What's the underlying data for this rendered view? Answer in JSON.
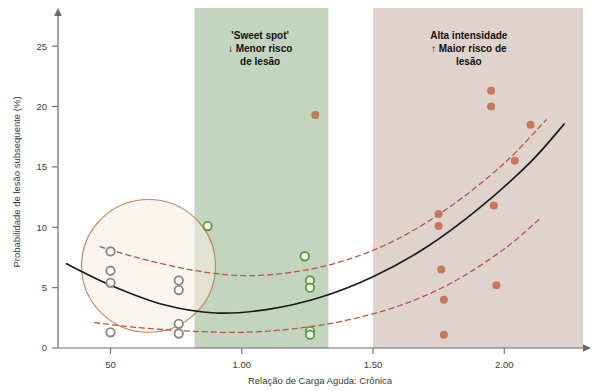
{
  "chart_data": {
    "type": "scatter",
    "title": "",
    "xlabel": "Relação de Carga Aguda: Crônica",
    "ylabel": "Probabilidade de lesão subsequente (%)",
    "xlim": [
      0.3,
      2.3
    ],
    "ylim": [
      0,
      27.5
    ],
    "xticks": [
      0.5,
      1.0,
      1.5,
      2.0
    ],
    "xticklabels": [
      "50",
      "1.00",
      "1.50",
      "2.00"
    ],
    "yticks": [
      0,
      5,
      10,
      15,
      20,
      25
    ],
    "yticklabels": [
      "0",
      "5",
      "10",
      "15",
      "20",
      "25"
    ],
    "grid": false,
    "legend": null,
    "series": [
      {
        "name": "Baixa carga (cinza)",
        "color": "#8a8a8a",
        "marker": "circle-open",
        "points": [
          {
            "x": 0.5,
            "y": 8.0
          },
          {
            "x": 0.5,
            "y": 6.4
          },
          {
            "x": 0.5,
            "y": 5.4
          },
          {
            "x": 0.5,
            "y": 1.3
          },
          {
            "x": 0.76,
            "y": 5.6
          },
          {
            "x": 0.76,
            "y": 4.8
          },
          {
            "x": 0.76,
            "y": 2.0
          },
          {
            "x": 0.76,
            "y": 1.2
          }
        ]
      },
      {
        "name": "Sweet spot (verde)",
        "color": "#5c9e3c",
        "marker": "circle-open",
        "points": [
          {
            "x": 0.87,
            "y": 10.1
          },
          {
            "x": 1.24,
            "y": 7.6
          },
          {
            "x": 1.26,
            "y": 5.6
          },
          {
            "x": 1.26,
            "y": 5.0
          },
          {
            "x": 1.26,
            "y": 1.4
          },
          {
            "x": 1.26,
            "y": 1.1
          }
        ]
      },
      {
        "name": "Alta intensidade (vermelho)",
        "color": "#c4714f",
        "marker": "circle-filled",
        "points": [
          {
            "x": 1.28,
            "y": 19.3
          },
          {
            "x": 1.75,
            "y": 11.1
          },
          {
            "x": 1.75,
            "y": 10.1
          },
          {
            "x": 1.76,
            "y": 6.5
          },
          {
            "x": 1.77,
            "y": 4.0
          },
          {
            "x": 1.77,
            "y": 1.1
          },
          {
            "x": 1.95,
            "y": 21.3
          },
          {
            "x": 1.95,
            "y": 20.0
          },
          {
            "x": 1.96,
            "y": 11.8
          },
          {
            "x": 1.97,
            "y": 5.2
          },
          {
            "x": 2.04,
            "y": 15.5
          },
          {
            "x": 2.1,
            "y": 18.5
          }
        ]
      }
    ],
    "fit_curve": {
      "name": "Curva ajustada",
      "color": "#1a1a1a",
      "style": "solid",
      "points": [
        {
          "x": 0.33,
          "y": 7.0
        },
        {
          "x": 0.5,
          "y": 5.2
        },
        {
          "x": 0.7,
          "y": 3.6
        },
        {
          "x": 0.9,
          "y": 2.9
        },
        {
          "x": 1.1,
          "y": 3.2
        },
        {
          "x": 1.3,
          "y": 4.2
        },
        {
          "x": 1.5,
          "y": 5.9
        },
        {
          "x": 1.7,
          "y": 8.3
        },
        {
          "x": 1.9,
          "y": 11.5
        },
        {
          "x": 2.1,
          "y": 15.4
        },
        {
          "x": 2.23,
          "y": 18.6
        }
      ]
    },
    "confidence_bands": [
      {
        "name": "Limite superior (IC 95%)",
        "color": "#b5593f",
        "style": "dashed",
        "points": [
          {
            "x": 0.46,
            "y": 8.4
          },
          {
            "x": 0.6,
            "y": 7.5
          },
          {
            "x": 0.8,
            "y": 6.5
          },
          {
            "x": 1.0,
            "y": 6.0
          },
          {
            "x": 1.2,
            "y": 6.3
          },
          {
            "x": 1.4,
            "y": 7.3
          },
          {
            "x": 1.6,
            "y": 9.1
          },
          {
            "x": 1.8,
            "y": 11.8
          },
          {
            "x": 2.0,
            "y": 15.3
          },
          {
            "x": 2.16,
            "y": 18.9
          }
        ]
      },
      {
        "name": "Limite inferior (IC 95%)",
        "color": "#b5593f",
        "style": "dashed",
        "points": [
          {
            "x": 0.44,
            "y": 2.1
          },
          {
            "x": 0.6,
            "y": 1.7
          },
          {
            "x": 0.8,
            "y": 1.4
          },
          {
            "x": 1.0,
            "y": 1.3
          },
          {
            "x": 1.2,
            "y": 1.6
          },
          {
            "x": 1.4,
            "y": 2.3
          },
          {
            "x": 1.6,
            "y": 3.5
          },
          {
            "x": 1.8,
            "y": 5.4
          },
          {
            "x": 2.0,
            "y": 8.2
          },
          {
            "x": 2.14,
            "y": 10.8
          }
        ]
      }
    ],
    "shaded_regions": [
      {
        "name": "sweet-spot-band",
        "x_start": 0.82,
        "x_end": 1.33,
        "color": "#b8cdb4",
        "opacity": 0.85
      },
      {
        "name": "alta-intensidade-band",
        "x_start": 1.5,
        "x_end": 2.3,
        "color": "#d4c2bb",
        "opacity": 0.72
      }
    ],
    "highlight_ellipse": {
      "name": "destaque-carga-baixa",
      "cx": 0.645,
      "cy": 6.8,
      "rx": 0.255,
      "ry": 5.5,
      "stroke": "#c07a4a",
      "fill": "#f7ede2"
    },
    "annotations": [
      {
        "name": "sweet-spot-annotation",
        "lines": [
          "'Sweet spot'",
          "↓ Menor risco",
          "de lesão"
        ],
        "x": 1.07,
        "y": 25.6
      },
      {
        "name": "alta-intensidade-annotation",
        "lines": [
          "Alta intensidade",
          "↑ Maior risco de",
          "lesão"
        ],
        "x": 1.865,
        "y": 25.6
      }
    ]
  },
  "axes": {
    "y_title": "Probabilidade de lesão subsequente (%)",
    "x_title": "Relação de Carga Aguda: Crônica",
    "y_tick_labels": [
      "0",
      "5",
      "10",
      "15",
      "20",
      "25"
    ],
    "x_tick_labels": [
      "50",
      "1.00",
      "1.50",
      "2.00"
    ]
  },
  "annotations": {
    "sweet_spot": {
      "line1": "'Sweet spot'",
      "line2": "↓ Menor risco",
      "line3": "de lesão"
    },
    "high_intensity": {
      "line1": "Alta intensidade",
      "line2": "↑ Maior risco de",
      "line3": "lesão"
    }
  },
  "colors": {
    "sweet_spot_band": "#b8cdb4",
    "high_band": "#d4c2bb",
    "gray_points": "#8a8a8a",
    "green_points": "#5c9e3c",
    "red_points": "#c4714f",
    "fit_curve": "#1a1a1a",
    "ci_band": "#b5593f",
    "ellipse_stroke": "#c07a4a"
  }
}
